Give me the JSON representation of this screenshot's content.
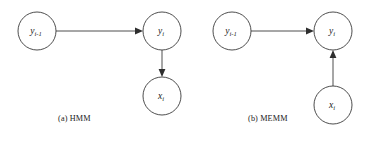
{
  "figure": {
    "background_color": "#ffffff",
    "stroke_color": "#3a3a3a",
    "label_color": "#1a1a1a"
  },
  "panels": [
    {
      "id": "hmm",
      "caption": "(a) HMM",
      "nodes": [
        {
          "id": "y-prev",
          "var": "y",
          "subscript": "i-1",
          "cx": 37,
          "cy": 31,
          "r": 19
        },
        {
          "id": "y-curr",
          "var": "y",
          "subscript": "i",
          "cx": 162,
          "cy": 31,
          "r": 19
        },
        {
          "id": "x-curr",
          "var": "x",
          "subscript": "i",
          "cx": 162,
          "cy": 96,
          "r": 19
        }
      ],
      "edges": [
        {
          "id": "y-prev-to-y-curr",
          "from": "y-prev",
          "to": "y-curr",
          "direction": "right"
        },
        {
          "id": "y-curr-to-x-curr",
          "from": "y-curr",
          "to": "x-curr",
          "direction": "down"
        }
      ]
    },
    {
      "id": "memm",
      "caption": "(b) MEMM",
      "nodes": [
        {
          "id": "y-prev",
          "var": "y",
          "subscript": "i-1",
          "cx": 232,
          "cy": 31,
          "r": 19
        },
        {
          "id": "y-curr",
          "var": "y",
          "subscript": "i",
          "cx": 333,
          "cy": 31,
          "r": 19
        },
        {
          "id": "x-curr",
          "var": "x",
          "subscript": "i",
          "cx": 333,
          "cy": 105,
          "r": 19
        }
      ],
      "edges": [
        {
          "id": "y-prev-to-y-curr",
          "from": "y-prev",
          "to": "y-curr",
          "direction": "right"
        },
        {
          "id": "x-curr-to-y-curr",
          "from": "x-curr",
          "to": "y-curr",
          "direction": "up"
        }
      ]
    }
  ]
}
